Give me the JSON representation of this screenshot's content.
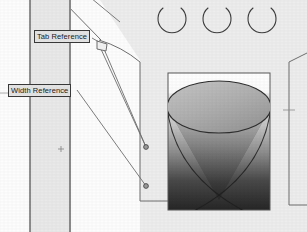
{
  "document": {
    "type": "engineering-drawing",
    "title": "Tab and Width Reference Detail"
  },
  "callouts": [
    {
      "id": "tab-reference",
      "label": "Tab Reference"
    },
    {
      "id": "width-reference",
      "label": "Width Reference"
    }
  ],
  "colors": {
    "page_background": "#fdfdfd",
    "panel_fill": "#ebebeb",
    "body_fill": "#ededed",
    "line": "#4a4a4a",
    "line_light": "#808080",
    "callout_fill": "#e4e4e4",
    "callout_border": "#3a3a3a",
    "callout_text": "#1a1a1a",
    "cone_top_light": "#b8b8b8",
    "cone_top_dark": "#9a9a9a",
    "cone_body_light": "#d8d8d8",
    "cone_body_dark": "#232323",
    "cone_shadow": "#5c5c5c",
    "marker_fill": "#9b9b9b"
  },
  "geometry": {
    "vertical_strip": {
      "x_left": 29,
      "x_right": 71,
      "y_top": 0,
      "y_bottom": 232
    },
    "crosshair_marker": {
      "x": 61,
      "y": 149,
      "size": 6
    },
    "top_arcs": [
      {
        "cx": 172,
        "cy": 20,
        "r": 14
      },
      {
        "cx": 217,
        "cy": 20,
        "r": 14
      },
      {
        "cx": 262,
        "cy": 20,
        "r": 14
      }
    ],
    "leader_endpoints": [
      {
        "x": 146,
        "y": 147
      },
      {
        "x": 146,
        "y": 186
      }
    ],
    "tab_marker": {
      "x": 97,
      "y": 42,
      "w": 10,
      "h": 9
    },
    "cone": {
      "top_ellipse_cx": 219,
      "top_ellipse_cy": 107,
      "top_ellipse_rx": 52,
      "top_ellipse_ry": 26,
      "apex_x": 219,
      "apex_y": 200
    },
    "render_panel": {
      "x": 168,
      "y": 73,
      "w": 102,
      "h": 137
    }
  }
}
